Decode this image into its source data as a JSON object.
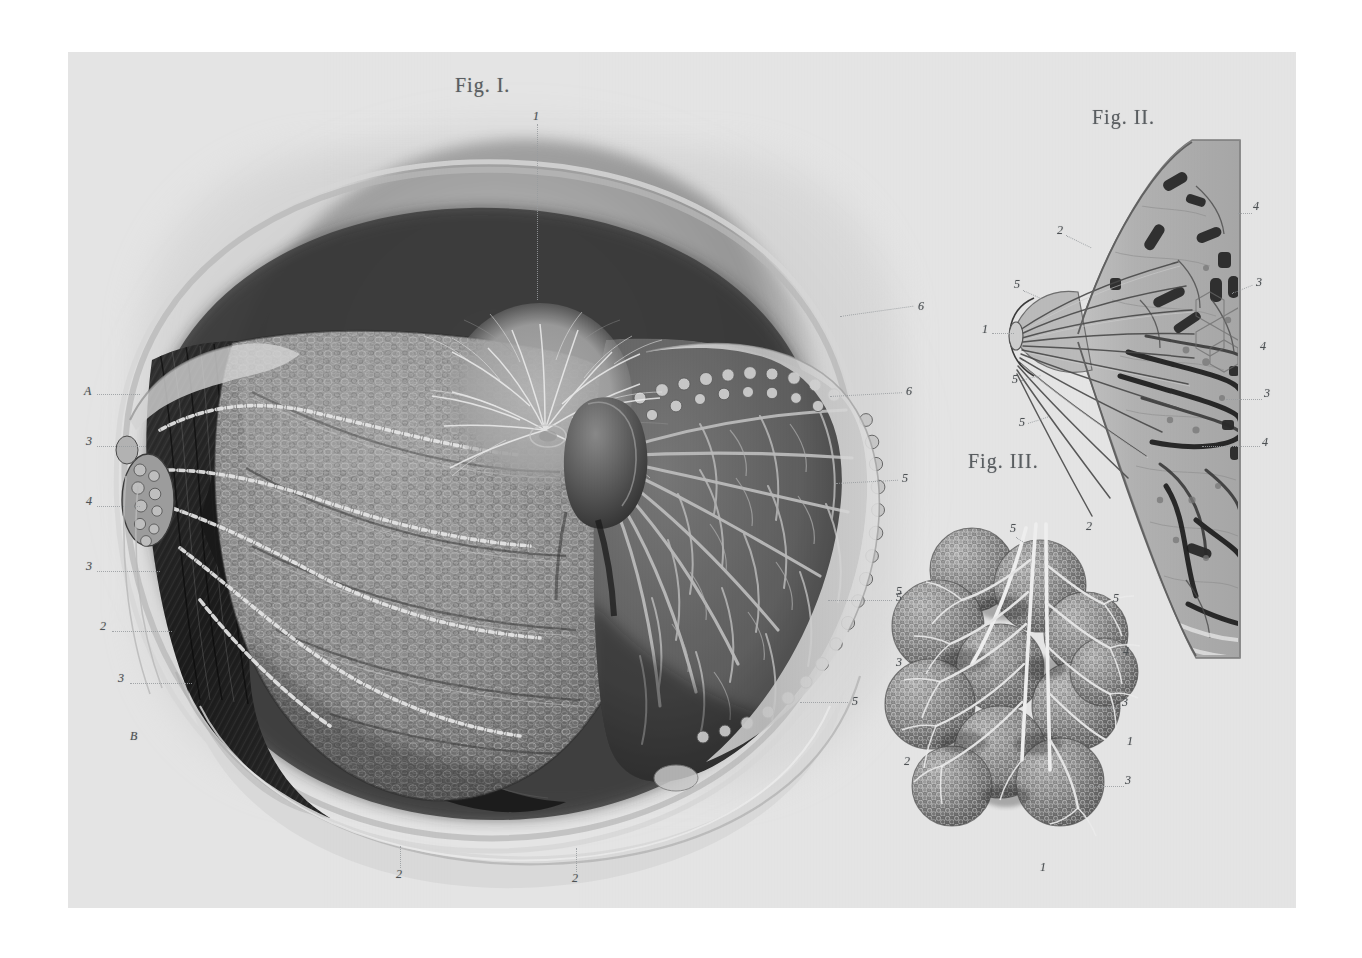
{
  "plate": {
    "kind": "anatomical-lithograph",
    "subject": "Mammary gland — dissection, sagittal section and lobules",
    "paper_color": "#e6e6e6",
    "ink_color": "#4e5255",
    "border_color": "#ffffff"
  },
  "figures": [
    {
      "id": "fig1",
      "title": "Fig. I.",
      "title_pos": {
        "x": 455,
        "y": 74
      },
      "description": "Anterior dissection of the breast: skin reflected, superficial fascia, lymphatic vessels with valves and axillary lymph nodes on the left, glandular lobes and lactiferous ducts radiating from the nipple on the right.",
      "labels": [
        {
          "text": "1",
          "x": 533,
          "y": 115,
          "side": "top",
          "lead": {
            "x1": 537,
            "y1": 124,
            "x2": 537,
            "y2": 300,
            "dir": "v"
          }
        },
        {
          "text": "A",
          "x": 84,
          "y": 390,
          "side": "left",
          "lead": {
            "x1": 97,
            "y1": 394,
            "x2": 140,
            "y2": 394,
            "dir": "h"
          }
        },
        {
          "text": "3",
          "x": 86,
          "y": 440,
          "side": "left",
          "lead": {
            "x1": 97,
            "y1": 446,
            "x2": 146,
            "y2": 446,
            "dir": "h"
          }
        },
        {
          "text": "4",
          "x": 86,
          "y": 500,
          "side": "left",
          "lead": {
            "x1": 97,
            "y1": 506,
            "x2": 140,
            "y2": 506,
            "dir": "h"
          }
        },
        {
          "text": "3",
          "x": 86,
          "y": 565,
          "side": "left",
          "lead": {
            "x1": 97,
            "y1": 571,
            "x2": 160,
            "y2": 571,
            "dir": "h"
          }
        },
        {
          "text": "2",
          "x": 100,
          "y": 625,
          "side": "left",
          "lead": {
            "x1": 112,
            "y1": 631,
            "x2": 172,
            "y2": 631,
            "dir": "h"
          }
        },
        {
          "text": "3",
          "x": 118,
          "y": 677,
          "side": "left",
          "lead": {
            "x1": 130,
            "y1": 683,
            "x2": 192,
            "y2": 683,
            "dir": "h"
          }
        },
        {
          "text": "B",
          "x": 130,
          "y": 735,
          "side": "left",
          "lead": null
        },
        {
          "text": "6",
          "x": 918,
          "y": 305,
          "side": "right",
          "lead": {
            "x1": 840,
            "y1": 330,
            "x2": 915,
            "y2": 310,
            "dir": "h"
          }
        },
        {
          "text": "6",
          "x": 906,
          "y": 390,
          "side": "right",
          "lead": {
            "x1": 830,
            "y1": 400,
            "x2": 903,
            "y2": 394,
            "dir": "h"
          }
        },
        {
          "text": "5",
          "x": 902,
          "y": 477,
          "side": "right",
          "lead": {
            "x1": 836,
            "y1": 486,
            "x2": 899,
            "y2": 481,
            "dir": "h"
          }
        },
        {
          "text": "5",
          "x": 896,
          "y": 596,
          "side": "right",
          "lead": {
            "x1": 828,
            "y1": 600,
            "x2": 893,
            "y2": 599,
            "dir": "h"
          }
        },
        {
          "text": "5",
          "x": 852,
          "y": 700,
          "side": "right",
          "lead": {
            "x1": 800,
            "y1": 702,
            "x2": 849,
            "y2": 702,
            "dir": "h"
          }
        },
        {
          "text": "2",
          "x": 396,
          "y": 873,
          "side": "bottom",
          "lead": {
            "x1": 400,
            "y1": 846,
            "x2": 400,
            "y2": 868,
            "dir": "v"
          }
        },
        {
          "text": "2",
          "x": 572,
          "y": 877,
          "side": "bottom",
          "lead": {
            "x1": 576,
            "y1": 848,
            "x2": 576,
            "y2": 872,
            "dir": "v"
          }
        }
      ]
    },
    {
      "id": "fig2",
      "title": "Fig. II.",
      "title_pos": {
        "x": 1092,
        "y": 106
      },
      "description": "Vertical (sagittal) section through the breast and nipple showing lactiferous sinuses, ducts converging on the nipple, adipose tissue and vessels of the chest wall.",
      "labels": [
        {
          "text": "2",
          "x": 1057,
          "y": 229,
          "side": "left",
          "lead": {
            "x1": 1066,
            "y1": 233,
            "x2": 1092,
            "y2": 247,
            "dir": "h"
          }
        },
        {
          "text": "5",
          "x": 1014,
          "y": 283,
          "side": "left",
          "lead": {
            "x1": 1023,
            "y1": 288,
            "x2": 1042,
            "y2": 297,
            "dir": "h"
          }
        },
        {
          "text": "1",
          "x": 982,
          "y": 328,
          "side": "left",
          "lead": {
            "x1": 992,
            "y1": 333,
            "x2": 1013,
            "y2": 333,
            "dir": "h"
          }
        },
        {
          "text": "5",
          "x": 1012,
          "y": 378,
          "side": "left",
          "lead": {
            "x1": 1021,
            "y1": 382,
            "x2": 1040,
            "y2": 377,
            "dir": "h"
          }
        },
        {
          "text": "5",
          "x": 1019,
          "y": 421,
          "side": "left",
          "lead": {
            "x1": 1028,
            "y1": 425,
            "x2": 1048,
            "y2": 418,
            "dir": "h"
          }
        },
        {
          "text": "4",
          "x": 1253,
          "y": 205,
          "side": "right",
          "lead": {
            "x1": 1238,
            "y1": 213,
            "x2": 1251,
            "y2": 210,
            "dir": "h"
          }
        },
        {
          "text": "3",
          "x": 1256,
          "y": 281,
          "side": "right",
          "lead": {
            "x1": 1232,
            "y1": 295,
            "x2": 1253,
            "y2": 286,
            "dir": "h"
          }
        },
        {
          "text": "4",
          "x": 1260,
          "y": 345,
          "side": "right",
          "lead": null
        },
        {
          "text": "3",
          "x": 1264,
          "y": 392,
          "side": "right",
          "lead": {
            "x1": 1226,
            "y1": 399,
            "x2": 1261,
            "y2": 397,
            "dir": "h"
          }
        },
        {
          "text": "4",
          "x": 1262,
          "y": 441,
          "side": "right",
          "lead": {
            "x1": 1202,
            "y1": 446,
            "x2": 1259,
            "y2": 446,
            "dir": "h"
          }
        }
      ]
    },
    {
      "id": "fig3",
      "title": "Fig. III.",
      "title_pos": {
        "x": 968,
        "y": 450
      },
      "description": "Cluster of mammary lobules (acini) with their small excretory ducts uniting into a larger lactiferous duct.",
      "labels": [
        {
          "text": "5",
          "x": 1010,
          "y": 527,
          "side": "top",
          "lead": {
            "x1": 1016,
            "y1": 536,
            "x2": 1030,
            "y2": 548,
            "dir": "h"
          }
        },
        {
          "text": "2",
          "x": 1086,
          "y": 525,
          "side": "top",
          "lead": null
        },
        {
          "text": "5",
          "x": 896,
          "y": 590,
          "side": "left",
          "lead": {
            "x1": 905,
            "y1": 595,
            "x2": 930,
            "y2": 600,
            "dir": "h"
          }
        },
        {
          "text": "3",
          "x": 896,
          "y": 661,
          "side": "left",
          "lead": {
            "x1": 905,
            "y1": 666,
            "x2": 928,
            "y2": 666,
            "dir": "h"
          }
        },
        {
          "text": "2",
          "x": 904,
          "y": 760,
          "side": "left",
          "lead": null
        },
        {
          "text": "5",
          "x": 1113,
          "y": 597,
          "side": "right",
          "lead": {
            "x1": 1092,
            "y1": 604,
            "x2": 1111,
            "y2": 602,
            "dir": "h"
          }
        },
        {
          "text": "4",
          "x": 1123,
          "y": 650,
          "side": "right",
          "lead": {
            "x1": 1106,
            "y1": 656,
            "x2": 1121,
            "y2": 654,
            "dir": "h"
          }
        },
        {
          "text": "3",
          "x": 1122,
          "y": 701,
          "side": "right",
          "lead": {
            "x1": 1096,
            "y1": 707,
            "x2": 1119,
            "y2": 705,
            "dir": "h"
          }
        },
        {
          "text": "1",
          "x": 1127,
          "y": 740,
          "side": "right",
          "lead": null
        },
        {
          "text": "3",
          "x": 1125,
          "y": 779,
          "side": "right",
          "lead": {
            "x1": 1090,
            "y1": 784,
            "x2": 1122,
            "y2": 783,
            "dir": "h"
          }
        },
        {
          "text": "1",
          "x": 1040,
          "y": 866,
          "side": "bottom",
          "lead": null
        }
      ]
    }
  ]
}
